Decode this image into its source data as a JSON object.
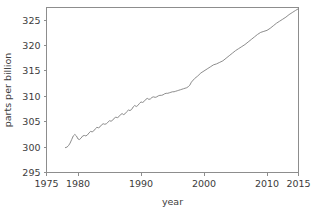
{
  "chart_data": {
    "type": "line",
    "title": "",
    "subtitle": "",
    "xlabel": "year",
    "ylabel": "parts per billion",
    "xlim": [
      1975,
      2015
    ],
    "ylim": [
      295,
      327.5
    ],
    "xticks": [
      1975,
      1980,
      1990,
      2000,
      2010,
      2015
    ],
    "xticklabels": [
      "1975",
      "1980",
      "1990",
      "2000",
      "2010",
      "2015"
    ],
    "yticks": [
      295,
      300,
      305,
      310,
      315,
      320,
      325
    ],
    "yticklabels": [
      "295",
      "300",
      "305",
      "310",
      "315",
      "320",
      "325"
    ],
    "grid": false,
    "legend": null,
    "annotations": [],
    "line_color": "#7f7f7f",
    "frame_color": "#8d8d8d",
    "background": "#ffffff",
    "series": [
      {
        "name": "atmospheric concentration",
        "x": [
          1978.0,
          1978.25,
          1978.5,
          1978.75,
          1979.0,
          1979.25,
          1979.5,
          1979.75,
          1980.0,
          1980.25,
          1980.5,
          1980.75,
          1981.0,
          1981.25,
          1981.5,
          1981.75,
          1982.0,
          1982.25,
          1982.5,
          1982.75,
          1983.0,
          1983.25,
          1983.5,
          1983.75,
          1984.0,
          1984.25,
          1984.5,
          1984.75,
          1985.0,
          1985.25,
          1985.5,
          1985.75,
          1986.0,
          1986.25,
          1986.5,
          1986.75,
          1987.0,
          1987.25,
          1987.5,
          1987.75,
          1988.0,
          1988.25,
          1988.5,
          1988.75,
          1989.0,
          1989.25,
          1989.5,
          1989.75,
          1990.0,
          1990.25,
          1990.5,
          1990.75,
          1991.0,
          1991.25,
          1991.5,
          1991.75,
          1992.0,
          1992.25,
          1992.5,
          1992.75,
          1993.0,
          1993.25,
          1993.5,
          1993.75,
          1994.0,
          1994.25,
          1994.5,
          1994.75,
          1995.0,
          1995.25,
          1995.5,
          1995.75,
          1996.0,
          1996.25,
          1996.5,
          1996.75,
          1997.0,
          1997.25,
          1997.5,
          1997.75,
          1998.0,
          1998.5,
          1999.0,
          1999.5,
          2000.0,
          2000.5,
          2001.0,
          2001.5,
          2002.0,
          2002.5,
          2003.0,
          2003.5,
          2004.0,
          2004.5,
          2005.0,
          2005.5,
          2006.0,
          2006.5,
          2007.0,
          2007.5,
          2008.0,
          2008.5,
          2009.0,
          2009.5,
          2010.0,
          2010.5,
          2011.0,
          2011.5,
          2012.0,
          2012.5,
          2013.0,
          2013.5,
          2014.0,
          2014.5,
          2014.9
        ],
        "y": [
          299.9,
          300.0,
          300.3,
          300.8,
          301.5,
          302.2,
          302.5,
          302.2,
          301.6,
          301.5,
          301.8,
          302.2,
          302.3,
          302.2,
          302.4,
          302.8,
          303.1,
          303.0,
          303.2,
          303.6,
          303.9,
          303.8,
          304.0,
          304.4,
          304.6,
          304.5,
          304.6,
          304.9,
          305.2,
          305.1,
          305.3,
          305.7,
          305.9,
          305.8,
          306.0,
          306.4,
          306.6,
          306.4,
          306.6,
          307.0,
          307.3,
          307.2,
          307.4,
          307.9,
          308.2,
          308.0,
          308.2,
          308.6,
          308.9,
          308.8,
          309.0,
          309.4,
          309.6,
          309.4,
          309.5,
          309.8,
          309.9,
          309.8,
          309.9,
          310.1,
          310.2,
          310.2,
          310.3,
          310.5,
          310.6,
          310.6,
          310.7,
          310.8,
          310.9,
          310.9,
          311.0,
          311.1,
          311.2,
          311.3,
          311.4,
          311.5,
          311.6,
          311.7,
          311.9,
          312.2,
          312.8,
          313.5,
          314.0,
          314.6,
          315.0,
          315.4,
          315.8,
          316.2,
          316.4,
          316.7,
          317.0,
          317.5,
          318.0,
          318.5,
          319.0,
          319.4,
          319.8,
          320.2,
          320.7,
          321.2,
          321.7,
          322.2,
          322.6,
          322.8,
          323.0,
          323.4,
          323.9,
          324.4,
          324.8,
          325.2,
          325.6,
          326.1,
          326.5,
          326.9,
          327.2
        ]
      }
    ]
  }
}
